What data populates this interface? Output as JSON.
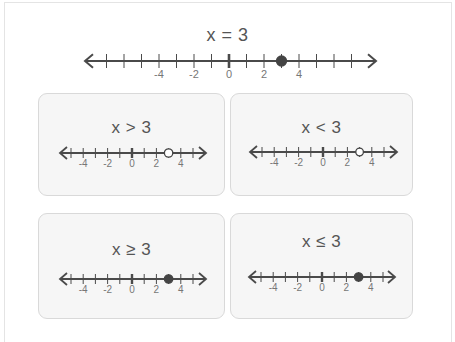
{
  "main": {
    "title": "x = 3",
    "line": {
      "min": -7,
      "max": 7,
      "labels": [
        "-4",
        "-2",
        "0",
        "2",
        "4"
      ],
      "point": 3,
      "point_type": "closed"
    }
  },
  "cards": [
    {
      "title": "x > 3",
      "min": -5,
      "max": 5,
      "labels": [
        "-4",
        "-2",
        "0",
        "2",
        "4"
      ],
      "point": 3,
      "point_type": "open"
    },
    {
      "title": "x < 3",
      "min": -5,
      "max": 5,
      "labels": [
        "-4",
        "-2",
        "0",
        "2",
        "4"
      ],
      "point": 3,
      "point_type": "open"
    },
    {
      "title": "x ≥ 3",
      "min": -5,
      "max": 5,
      "labels": [
        "-4",
        "-2",
        "0",
        "2",
        "4"
      ],
      "point": 3,
      "point_type": "closed"
    },
    {
      "title": "x ≤ 3",
      "min": -5,
      "max": 5,
      "labels": [
        "-4",
        "-2",
        "0",
        "2",
        "4"
      ],
      "point": 3,
      "point_type": "closed"
    }
  ],
  "colors": {
    "line": "#4a4a4a",
    "point": "#444444",
    "card_bg": "#f6f6f6",
    "card_border": "#d9d9d9",
    "text": "#555555"
  }
}
